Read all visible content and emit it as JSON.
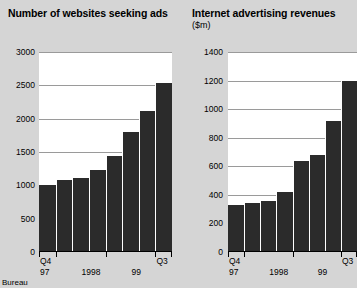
{
  "source_note": "Bureau",
  "colors": {
    "background": "#d5d5d5",
    "plot_background": "#ffffff",
    "bar": "#2b2b2b",
    "gridline": "#9a9a9a",
    "axis": "#000000"
  },
  "charts": [
    {
      "id": "websites-seeking-ads",
      "title": "Number of websites seeking ads",
      "subtitle": ""
    },
    {
      "id": "internet-advertising-revenues",
      "title": "Internet advertising revenues",
      "subtitle": "($m)"
    }
  ],
  "chart_data": [
    {
      "type": "bar",
      "title": "Number of websites seeking ads",
      "subtitle": "",
      "xlabel": "",
      "ylabel": "",
      "ylim": [
        0,
        3000
      ],
      "yticks": [
        0,
        500,
        1000,
        1500,
        2000,
        2500,
        3000
      ],
      "ytick_labels": [
        "0",
        "500",
        "1000",
        "1500",
        "2000",
        "2500",
        "3000"
      ],
      "grid": true,
      "legend": null,
      "categories": [
        "Q4 97",
        "Q1 98",
        "Q2 98",
        "Q3 98",
        "Q4 98",
        "Q1 99",
        "Q2 99",
        "Q3 99"
      ],
      "values": [
        1000,
        1080,
        1110,
        1230,
        1440,
        1800,
        2120,
        2540
      ],
      "axis_group_labels": [
        {
          "label": "Q4",
          "sub": "97",
          "position": 0
        },
        {
          "label": "",
          "sub": "1998",
          "position": 2.5
        },
        {
          "label": "",
          "sub": "99",
          "position": 5.5
        },
        {
          "label": "Q3",
          "sub": "",
          "position": 7
        }
      ]
    },
    {
      "type": "bar",
      "title": "Internet advertising revenues",
      "subtitle": "($m)",
      "xlabel": "",
      "ylabel": "$m",
      "ylim": [
        0,
        1400
      ],
      "yticks": [
        0,
        200,
        400,
        600,
        800,
        1000,
        1200,
        1400
      ],
      "ytick_labels": [
        "0",
        "200",
        "400",
        "600",
        "800",
        "1000",
        "1200",
        "1400"
      ],
      "grid": true,
      "legend": null,
      "categories": [
        "Q4 97",
        "Q1 98",
        "Q2 98",
        "Q3 98",
        "Q4 98",
        "Q1 99",
        "Q2 99",
        "Q3 99"
      ],
      "values": [
        330,
        340,
        360,
        420,
        640,
        680,
        920,
        1200
      ],
      "axis_group_labels": [
        {
          "label": "Q4",
          "sub": "97",
          "position": 0
        },
        {
          "label": "",
          "sub": "1998",
          "position": 2.5
        },
        {
          "label": "",
          "sub": "99",
          "position": 5.5
        },
        {
          "label": "Q3",
          "sub": "",
          "position": 7
        }
      ]
    }
  ]
}
